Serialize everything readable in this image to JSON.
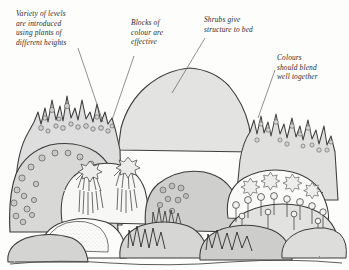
{
  "figure": {
    "kind": "hand-drawn-garden-border-illustration",
    "medium": "pen-and-ink with grey wash",
    "background_color": "#fdfdfc",
    "ink_color": "#3a3a3a",
    "wash_colors": [
      "#ffffff",
      "#f3f3f1",
      "#e8e8e6",
      "#dcdcda",
      "#d0d0ce",
      "#c6c6c4"
    ]
  },
  "annotations": [
    {
      "id": "levels",
      "lines": [
        "Variety of levels",
        "are introduced",
        "using plants of",
        "different heights"
      ],
      "text": "Variety of levels\nare introduced\nusing plants of\ndifferent heights",
      "leader_from": [
        78,
        48
      ],
      "leader_to": [
        103,
        122
      ]
    },
    {
      "id": "blocks",
      "lines": [
        "Blocks of",
        "colour are",
        "effective"
      ],
      "text": "Blocks of\ncolour are\neffective",
      "leader_from": [
        134,
        56
      ],
      "leader_to": [
        112,
        120
      ]
    },
    {
      "id": "shrubs",
      "lines": [
        "Shrubs give",
        "structure to bed"
      ],
      "text": "Shrubs give\nstructure to bed",
      "leader_from": [
        205,
        38
      ],
      "leader_to": [
        172,
        93
      ]
    },
    {
      "id": "colours",
      "lines": [
        "Colours",
        "should blend",
        "well together"
      ],
      "text": "Colours\nshould blend\nwell together",
      "leader_from": [
        275,
        70
      ],
      "leader_to": [
        258,
        118
      ]
    }
  ],
  "plant_groups": [
    {
      "id": "tall-spires-left",
      "label": "tall spiky flower spires",
      "zone": "back-left",
      "height_band": "tall"
    },
    {
      "id": "berry-mound-left",
      "label": "round berry cluster mound",
      "zone": "mid-left",
      "height_band": "medium"
    },
    {
      "id": "shrub-mass-centre",
      "label": "large rounded shrub",
      "zone": "back-centre",
      "height_band": "tall"
    },
    {
      "id": "spiky-grass-centre",
      "label": "strap-leaved grasses",
      "zone": "mid-centre",
      "height_band": "medium"
    },
    {
      "id": "star-flowers-right",
      "label": "star-shaped flower heads",
      "zone": "mid-right",
      "height_band": "medium"
    },
    {
      "id": "allium-row-right",
      "label": "lollipop allium heads",
      "zone": "front-right",
      "height_band": "low"
    },
    {
      "id": "front-mounds",
      "label": "low edging mounds",
      "zone": "front",
      "height_band": "low"
    }
  ]
}
